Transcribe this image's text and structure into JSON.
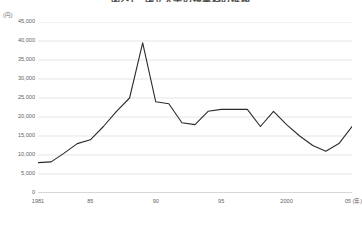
{
  "chart": {
    "title": "図2-1　国立大学の授業料の推移",
    "y_unit": "(円)",
    "x_unit": "(年)"
  },
  "chart_data": {
    "type": "line",
    "title": "図2-1　国立大学の授業料の推移",
    "xlabel": "(年)",
    "ylabel": "(円)",
    "ylim": [
      0,
      45000
    ],
    "xlim": [
      1981,
      2005
    ],
    "grid": true,
    "legend": null,
    "y_ticks": [
      {
        "value": 45000,
        "label": "45,000"
      },
      {
        "value": 40000,
        "label": "40,000"
      },
      {
        "value": 35000,
        "label": "35,000"
      },
      {
        "value": 30000,
        "label": "30,000"
      },
      {
        "value": 25000,
        "label": "25,000"
      },
      {
        "value": 20000,
        "label": "20,000"
      },
      {
        "value": 15000,
        "label": "15,000"
      },
      {
        "value": 10000,
        "label": "10,000"
      },
      {
        "value": 5000,
        "label": "5,000"
      },
      {
        "value": 0,
        "label": "0"
      }
    ],
    "x_ticks": [
      {
        "value": 1981,
        "label": "1981"
      },
      {
        "value": 1985,
        "label": "85"
      },
      {
        "value": 1990,
        "label": "90"
      },
      {
        "value": 1995,
        "label": "95"
      },
      {
        "value": 2000,
        "label": "2000"
      },
      {
        "value": 2005,
        "label": "05"
      }
    ],
    "series": [
      {
        "name": "値",
        "color": "#2b2b2b",
        "x": [
          1981,
          1982,
          1983,
          1984,
          1985,
          1986,
          1987,
          1988,
          1989,
          1990,
          1991,
          1992,
          1993,
          1994,
          1995,
          1996,
          1997,
          1998,
          1999,
          2000,
          2001,
          2002,
          2003,
          2004,
          2005
        ],
        "values": [
          8000,
          8200,
          10500,
          13000,
          14000,
          17500,
          21500,
          25000,
          39500,
          24000,
          23500,
          18500,
          18000,
          21500,
          22000,
          22000,
          22000,
          17500,
          21500,
          18000,
          15000,
          12500,
          11000,
          13000,
          17500
        ]
      }
    ]
  }
}
